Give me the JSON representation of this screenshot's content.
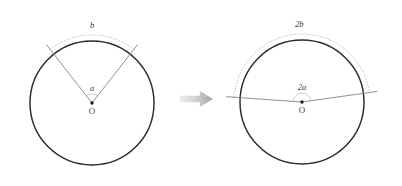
{
  "figure": {
    "background_color": "#ffffff",
    "width": 402,
    "height": 186
  },
  "colors": {
    "circle_stroke": "#2b2b2b",
    "ray_stroke": "#8a8a8a",
    "dotted_arc_stroke": "#b5b0ad",
    "angle_arc_stroke": "#c6c2c0",
    "center_dot": "#1a1a1a",
    "label_text": "#3a3a3a",
    "arrow_fill_light": "#e3e3e3",
    "arrow_fill_dark": "#a9a9a9"
  },
  "left_panel": {
    "name": "original-circle",
    "center": {
      "x": 92,
      "y": 103,
      "label": "O"
    },
    "radius": 62,
    "angle_label": "a",
    "arc_label": "b",
    "angle_start_deg": 128,
    "angle_end_deg": 52,
    "ray_overshoot": 12,
    "dotted_arc_offset": 6,
    "angle_marker_radius": 9
  },
  "right_panel": {
    "name": "doubled-circle",
    "center": {
      "x": 302,
      "y": 102,
      "label": "O"
    },
    "radius": 62,
    "angle_label": "2a",
    "arc_label": "2b",
    "angle_start_deg": 176,
    "angle_end_deg": 8,
    "ray_overshoot": 14,
    "dotted_arc_offset": 6,
    "angle_marker_radius": 9
  },
  "arrow": {
    "name": "transformation-arrow",
    "x": 180,
    "y": 91,
    "width": 33,
    "height": 16,
    "direction": "right"
  },
  "chart_data": {
    "type": "diagram",
    "panels": [
      {
        "id": "left",
        "center_label": "O",
        "angle": "a",
        "arc": "b",
        "radius_px": 62,
        "angle_span_deg": 76
      },
      {
        "id": "right",
        "center_label": "O",
        "angle": "2a",
        "arc": "2b",
        "radius_px": 62,
        "angle_span_deg": 168
      }
    ],
    "relation": "arc length is proportional to central angle"
  }
}
